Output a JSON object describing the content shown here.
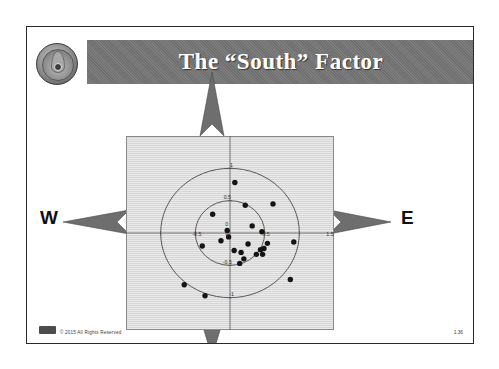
{
  "slide": {
    "title": "The “South” Factor",
    "logo_name": "organization-seal",
    "footer_text": "© 2015 All Rights Reserved",
    "page_number": "1.36"
  },
  "compass": {
    "west_label": "W",
    "east_label": "E",
    "north_arrow": "arrow-north",
    "south_arrow": "arrow-south",
    "west_arrow": "arrow-west",
    "east_arrow": "arrow-east"
  },
  "colors": {
    "banner": "#6f6f6f",
    "title_text": "#ffffff",
    "plot_background": "#d7d7d7",
    "point": "#141414",
    "axis": "#555555",
    "circle": "#4a4a4a",
    "frame": "#2a2a2a"
  },
  "chart_data": {
    "type": "scatter",
    "title": "The “South” Factor",
    "xlabel": "",
    "ylabel": "",
    "xlim": [
      -1.5,
      1.5
    ],
    "ylim": [
      -1.5,
      1.5
    ],
    "grid": false,
    "axis_ticks_x": [
      "-1.5",
      "-0.5",
      "0",
      "0.5",
      "1.5"
    ],
    "axis_ticks_y": [
      "-1",
      "0",
      "0.5",
      "1"
    ],
    "tick_labels_shown": [
      "1",
      "0.5",
      "0",
      "-0.5",
      "0.5",
      "-1",
      "1.5"
    ],
    "annotations": [
      {
        "text": "1",
        "x": 0.0,
        "y": 1.0
      },
      {
        "text": "0.5",
        "x": -0.06,
        "y": 0.5
      },
      {
        "text": "0",
        "x": -0.07,
        "y": 0.09
      },
      {
        "text": "0",
        "x": -0.07,
        "y": -0.05
      },
      {
        "text": "-0.5",
        "x": -0.5,
        "y": -0.07
      },
      {
        "text": "0.5",
        "x": 0.5,
        "y": -0.07
      },
      {
        "text": "-0.5",
        "x": -0.06,
        "y": -0.5
      },
      {
        "text": "-1",
        "x": 0.0,
        "y": -1.0
      },
      {
        "text": "1.5",
        "x": 1.42,
        "y": -0.07
      }
    ],
    "reference_circles": [
      {
        "name": "unit-circle",
        "radius": 1.0
      },
      {
        "name": "half-circle",
        "radius": 0.5
      }
    ],
    "series": [
      {
        "name": "observations",
        "marker": "filled-circle",
        "color": "#141414",
        "points": [
          [
            0.07,
            0.78
          ],
          [
            0.22,
            0.43
          ],
          [
            0.62,
            0.45
          ],
          [
            -0.25,
            0.29
          ],
          [
            0.32,
            0.11
          ],
          [
            0.46,
            0.02
          ],
          [
            -0.04,
            0.04
          ],
          [
            -0.02,
            -0.06
          ],
          [
            -0.13,
            -0.12
          ],
          [
            -0.4,
            -0.2
          ],
          [
            0.26,
            -0.17
          ],
          [
            0.54,
            -0.16
          ],
          [
            0.92,
            -0.14
          ],
          [
            0.06,
            -0.27
          ],
          [
            0.16,
            -0.3
          ],
          [
            0.44,
            -0.26
          ],
          [
            0.49,
            -0.24
          ],
          [
            0.38,
            -0.33
          ],
          [
            0.47,
            -0.33
          ],
          [
            0.2,
            -0.4
          ],
          [
            0.14,
            -0.47
          ],
          [
            -0.66,
            -0.8
          ],
          [
            -0.36,
            -0.97
          ],
          [
            0.87,
            -0.72
          ]
        ]
      }
    ]
  }
}
